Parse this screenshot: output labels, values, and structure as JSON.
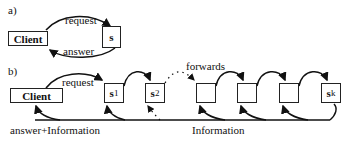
{
  "panel_a": {
    "label": "a)",
    "client": "Client",
    "server": "s",
    "request": "request",
    "answer": "answer"
  },
  "panel_b": {
    "label": "b)",
    "client": "Client",
    "request": "request",
    "forwards": "forwards",
    "servers": [
      {
        "main": "s",
        "sub": "1"
      },
      {
        "main": "s",
        "sub": "2"
      },
      {
        "main": "",
        "sub": ""
      },
      {
        "main": "",
        "sub": ""
      },
      {
        "main": "",
        "sub": ""
      },
      {
        "main": "s",
        "sub": "k"
      }
    ],
    "answer_info": "answer+Information",
    "information": "Information"
  }
}
